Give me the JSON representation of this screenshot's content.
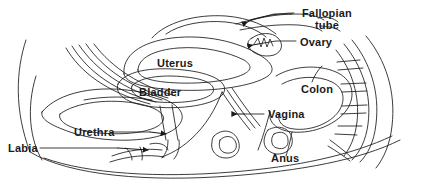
{
  "diagram": {
    "type": "labeled-anatomical-line-drawing",
    "background_color": "#ffffff",
    "line_color": "#1a1a1a",
    "text_color": "#1a1a1a",
    "width": 421,
    "height": 184,
    "labels": [
      {
        "id": "fallopian-tube",
        "text": "Fallopian\ntube",
        "line1": "Fallopian",
        "line2": "tube",
        "x": 296,
        "y": 8,
        "font_size": 11,
        "lines": 2,
        "leader": "dash-left",
        "arrow": "left"
      },
      {
        "id": "ovary",
        "text": "Ovary",
        "x": 300,
        "y": 36,
        "font_size": 11,
        "lines": 1,
        "leader": "dash-left",
        "arrow": "left"
      },
      {
        "id": "uterus",
        "text": "Uterus",
        "x": 157,
        "y": 57,
        "font_size": 11,
        "lines": 1,
        "leader": "none",
        "arrow": "none"
      },
      {
        "id": "bladder",
        "text": "Bladder",
        "x": 139,
        "y": 86,
        "font_size": 11,
        "lines": 1,
        "leader": "none",
        "arrow": "none"
      },
      {
        "id": "colon",
        "text": "Colon",
        "x": 301,
        "y": 83,
        "font_size": 11,
        "lines": 1,
        "leader": "none",
        "arrow": "none"
      },
      {
        "id": "vagina",
        "text": "Vagina",
        "x": 268,
        "y": 110,
        "font_size": 11,
        "lines": 1,
        "leader": "dash-left",
        "arrow": "left"
      },
      {
        "id": "urethra",
        "text": "Urethra",
        "x": 74,
        "y": 128,
        "font_size": 11,
        "lines": 1,
        "leader": "line-right",
        "arrow": "right"
      },
      {
        "id": "labia",
        "text": "Labia",
        "x": 8,
        "y": 143,
        "font_size": 11,
        "lines": 1,
        "leader": "line-right",
        "arrow": "right"
      },
      {
        "id": "anus",
        "text": "Anus",
        "x": 271,
        "y": 152,
        "font_size": 11,
        "lines": 1,
        "leader": "none",
        "arrow": "none"
      }
    ]
  }
}
